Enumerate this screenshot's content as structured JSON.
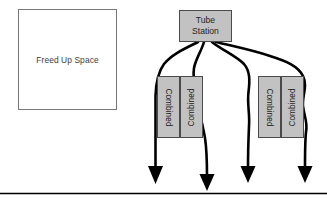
{
  "diagram": {
    "background_color": "#ffffff",
    "nodes": {
      "freed_up_space": {
        "label": "Freed Up Space",
        "fill": "#ffffff",
        "stroke": "#77777a"
      },
      "tube_station": {
        "label_line1": "Tube",
        "label_line2": "Station",
        "fill": "#c2c2c2",
        "stroke": "#4a4a4d"
      },
      "combined_left_a": {
        "label": "Combined",
        "orientation": "rotated-clockwise",
        "fill": "#c2c2c2",
        "stroke": "#4a4a4d"
      },
      "combined_left_b": {
        "label": "Combined",
        "orientation": "rotated-counterclockwise",
        "fill": "#c2c2c2",
        "stroke": "#4a4a4d"
      },
      "combined_right_a": {
        "label": "Combined",
        "orientation": "rotated-clockwise",
        "fill": "#c2c2c2",
        "stroke": "#4a4a4d"
      },
      "combined_right_b": {
        "label": "Combined",
        "orientation": "rotated-counterclockwise",
        "fill": "#c2c2c2",
        "stroke": "#4a4a4d"
      }
    },
    "connectors": {
      "count": 4,
      "stroke": "#000000",
      "arrowhead": "solid-triangle",
      "description": "Four curved flow lines leaving the Tube Station downward, passing the Combined blocks and terminating in arrowheads above the baseline"
    },
    "baseline": {
      "stroke": "#000000",
      "description": "Horizontal baseline across the bottom of the diagram"
    }
  }
}
